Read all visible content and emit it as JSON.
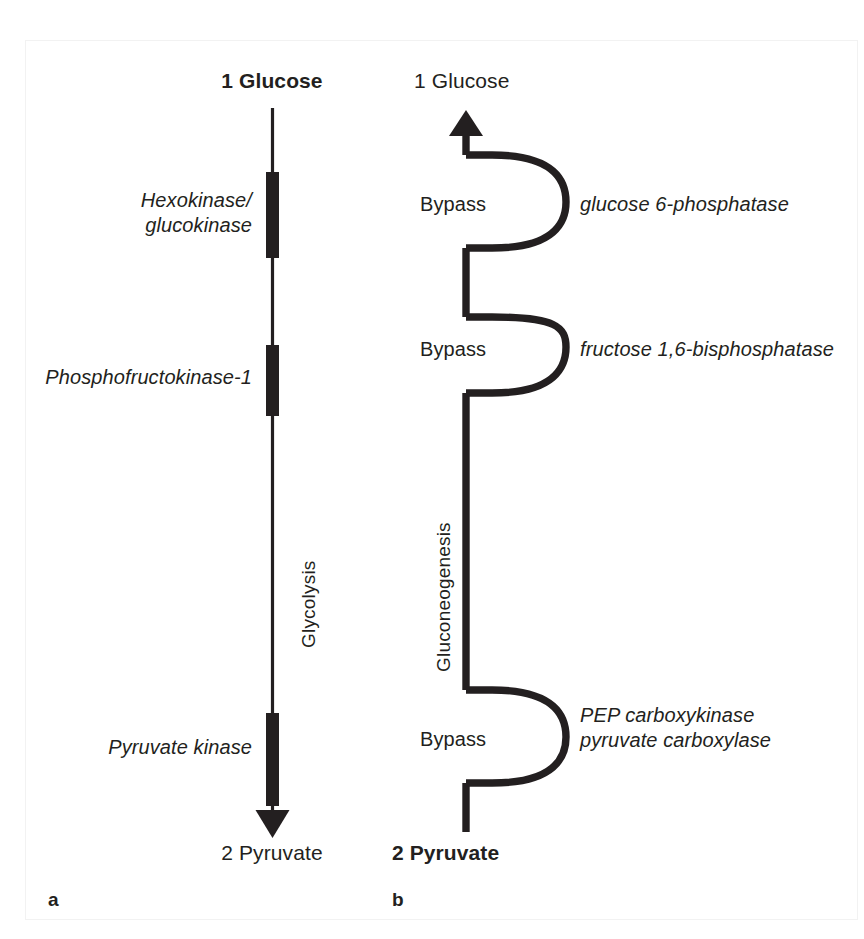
{
  "figure": {
    "panels": [
      {
        "letter": "a",
        "pathway_label": "Glycolysis",
        "top_compound": "1 Glucose",
        "bottom_compound": "2 Pyruvate",
        "steps": [
          {
            "enzyme": "Hexokinase/\nglucokinase"
          },
          {
            "enzyme": "Phosphofructokinase-1"
          },
          {
            "enzyme": "Pyruvate kinase"
          }
        ]
      },
      {
        "letter": "b",
        "pathway_label": "Gluconeogenesis",
        "top_compound": "1 Glucose",
        "bottom_compound": "2 Pyruvate",
        "steps": [
          {
            "bypass": "Bypass",
            "enzyme": "glucose 6-phosphatase"
          },
          {
            "bypass": "Bypass",
            "enzyme": "fructose 1,6-bisphosphatase"
          },
          {
            "bypass": "Bypass",
            "enzyme": "PEP carboxykinase\npyruvate carboxylase"
          }
        ]
      }
    ],
    "colors": {
      "ink": "#231f20",
      "background": "#ffffff",
      "frame": "#f2f2f2"
    }
  }
}
